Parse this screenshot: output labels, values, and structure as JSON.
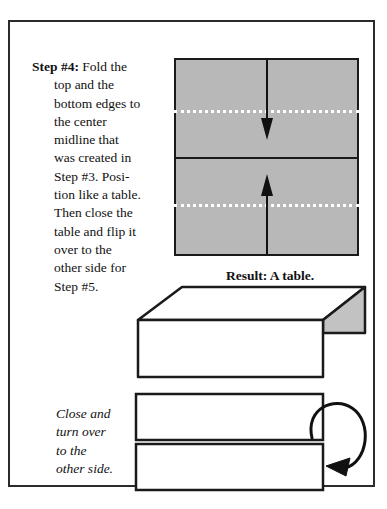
{
  "document": {
    "title": "Origami Step #4 Instructions"
  },
  "step": {
    "label": "Step #4:",
    "lines": [
      "Fold the",
      "top and the",
      "bottom edges to",
      "the center",
      "midline that",
      "was created in",
      "Step #3. Posi-",
      "tion like a table.",
      "Then close the",
      "table and flip it",
      "over to the",
      "other side for",
      "Step #5."
    ],
    "full_text": "Step #4: Fold the top and the bottom edges to the center midline that was created in Step #3. Position like a table. Then close the table and flip it over to the other side for Step #5."
  },
  "result": {
    "caption": "Result: A table."
  },
  "flip": {
    "lines": [
      "Close and",
      "turn over",
      "to the",
      "other side."
    ],
    "full_text": "Close and turn over to the other side."
  },
  "colors": {
    "paper_gray": "#b8b8b8",
    "shadow_gray": "#c2c2c2",
    "ink": "#1a1a1a",
    "frame": "#2b2b2b",
    "background": "#ffffff",
    "fold_line": "#ffffff"
  },
  "icons": {
    "fold_down_arrow": "down-arrow-icon",
    "fold_up_arrow": "up-arrow-icon",
    "flip_over_arrow": "circular-flip-arrow-icon"
  }
}
